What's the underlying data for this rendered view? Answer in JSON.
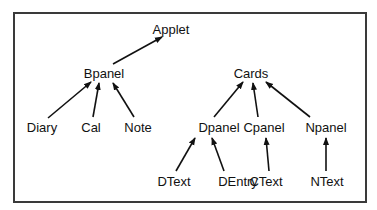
{
  "diagram": {
    "type": "tree",
    "edge_color": "#111111",
    "frame_color": "#3a3a3a",
    "nodes": [
      {
        "id": "applet",
        "label": "Applet",
        "x": 171,
        "y": 29
      },
      {
        "id": "bpanel",
        "label": "Bpanel",
        "x": 104,
        "y": 73
      },
      {
        "id": "cards",
        "label": "Cards",
        "x": 251,
        "y": 73
      },
      {
        "id": "diary",
        "label": "Diary",
        "x": 42,
        "y": 127
      },
      {
        "id": "cal",
        "label": "Cal",
        "x": 91,
        "y": 127
      },
      {
        "id": "note",
        "label": "Note",
        "x": 138,
        "y": 127
      },
      {
        "id": "dpanel",
        "label": "Dpanel",
        "x": 219,
        "y": 127
      },
      {
        "id": "cpanel",
        "label": "Cpanel",
        "x": 264,
        "y": 127
      },
      {
        "id": "npanel",
        "label": "Npanel",
        "x": 326,
        "y": 127
      },
      {
        "id": "dtext",
        "label": "DText",
        "x": 174,
        "y": 181
      },
      {
        "id": "dentry",
        "label": "DEntry",
        "x": 238,
        "y": 181
      },
      {
        "id": "ctext",
        "label": "CText",
        "x": 266,
        "y": 181
      },
      {
        "id": "ntext",
        "label": "NText",
        "x": 327,
        "y": 181
      }
    ],
    "edges": [
      {
        "from": "bpanel",
        "to": "applet",
        "x1": 113,
        "y1": 64,
        "x2": 162,
        "y2": 37
      },
      {
        "from": "diary",
        "to": "bpanel",
        "x1": 48,
        "y1": 118,
        "x2": 91,
        "y2": 82
      },
      {
        "from": "cal",
        "to": "bpanel",
        "x1": 93,
        "y1": 117,
        "x2": 99,
        "y2": 83
      },
      {
        "from": "note",
        "to": "bpanel",
        "x1": 134,
        "y1": 117,
        "x2": 113,
        "y2": 83
      },
      {
        "from": "dpanel",
        "to": "cards",
        "x1": 214,
        "y1": 117,
        "x2": 243,
        "y2": 82
      },
      {
        "from": "cpanel",
        "to": "cards",
        "x1": 258,
        "y1": 117,
        "x2": 253,
        "y2": 83
      },
      {
        "from": "npanel",
        "to": "cards",
        "x1": 310,
        "y1": 117,
        "x2": 266,
        "y2": 82
      },
      {
        "from": "dtext",
        "to": "dpanel",
        "x1": 176,
        "y1": 171,
        "x2": 195,
        "y2": 138
      },
      {
        "from": "dentry",
        "to": "dpanel",
        "x1": 224,
        "y1": 171,
        "x2": 212,
        "y2": 138
      },
      {
        "from": "ctext",
        "to": "cpanel",
        "x1": 269,
        "y1": 171,
        "x2": 266,
        "y2": 138
      },
      {
        "from": "ntext",
        "to": "npanel",
        "x1": 326,
        "y1": 171,
        "x2": 326,
        "y2": 138
      }
    ]
  }
}
